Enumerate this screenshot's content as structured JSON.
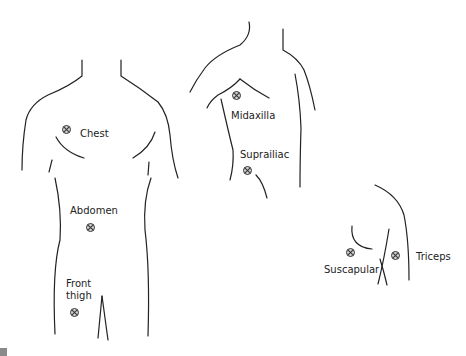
{
  "figure": {
    "views": [
      "front",
      "side",
      "back"
    ],
    "sites": [
      {
        "id": "chest",
        "label": "Chest",
        "x": 66,
        "y": 129,
        "lx": 80,
        "ly": 128
      },
      {
        "id": "abdomen",
        "label": "Abdomen",
        "x": 87,
        "y": 224,
        "lx": 71,
        "ly": 205
      },
      {
        "id": "front_thigh",
        "label": "Front\nthigh",
        "x": 71,
        "y": 309,
        "lx": 66,
        "ly": 278
      },
      {
        "id": "midaxilla",
        "label": "Midaxilla",
        "x": 233,
        "y": 92,
        "lx": 231,
        "ly": 111
      },
      {
        "id": "suprailiac",
        "label": "Suprailiac",
        "x": 244,
        "y": 170,
        "lx": 240,
        "ly": 148
      },
      {
        "id": "suscapular",
        "label": "Suscapular",
        "x": 347,
        "y": 252,
        "lx": 324,
        "ly": 266
      },
      {
        "id": "triceps",
        "label": "Triceps",
        "x": 395,
        "y": 254,
        "lx": 416,
        "ly": 252
      }
    ]
  },
  "labels": {
    "chest": "Chest",
    "abdomen": "Abdomen",
    "front_thigh_1": "Front",
    "front_thigh_2": "thigh",
    "midaxilla": "Midaxilla",
    "suprailiac": "Suprailiac",
    "suscapular": "Suscapular",
    "triceps": "Triceps"
  },
  "colors": {
    "line": "#222222",
    "marker_fill": "#cfcfcf",
    "background": "#ffffff"
  }
}
